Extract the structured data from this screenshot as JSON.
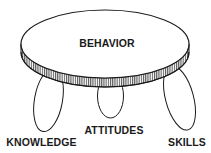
{
  "diagram": {
    "type": "three-legged-stool",
    "seat": {
      "label": "BEHAVIOR"
    },
    "legs": [
      {
        "label": "KNOWLEDGE"
      },
      {
        "label": "ATTITUDES"
      },
      {
        "label": "SKILLS"
      }
    ]
  },
  "colors": {
    "line": "#1a1a1a",
    "background": "#ffffff"
  }
}
